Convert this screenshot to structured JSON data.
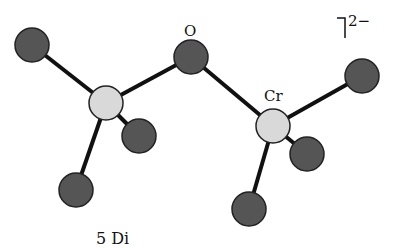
{
  "figure": {
    "charge_label": "2−",
    "labels": {
      "oxygen": "O",
      "chromium": "Cr"
    },
    "caption_fragment": "5  Di",
    "colors": {
      "oxygen_fill": "#555555",
      "chromium_fill": "#d9d9d9",
      "bond": "#111111",
      "outline": "#222222"
    },
    "atoms": [
      {
        "id": "O_bridge",
        "element": "O",
        "x": 191,
        "y": 57,
        "r": 17
      },
      {
        "id": "Cr1",
        "element": "Cr",
        "x": 106,
        "y": 103,
        "r": 17
      },
      {
        "id": "Cr2",
        "element": "Cr",
        "x": 273,
        "y": 126,
        "r": 17
      },
      {
        "id": "O1a",
        "element": "O",
        "x": 32,
        "y": 45,
        "r": 17
      },
      {
        "id": "O1b",
        "element": "O",
        "x": 139,
        "y": 136,
        "r": 17
      },
      {
        "id": "O1c",
        "element": "O",
        "x": 76,
        "y": 190,
        "r": 17
      },
      {
        "id": "O2a",
        "element": "O",
        "x": 362,
        "y": 76,
        "r": 17
      },
      {
        "id": "O2b",
        "element": "O",
        "x": 307,
        "y": 154,
        "r": 17
      },
      {
        "id": "O2c",
        "element": "O",
        "x": 249,
        "y": 209,
        "r": 17
      }
    ],
    "bonds": [
      [
        "Cr1",
        "O_bridge"
      ],
      [
        "O_bridge",
        "Cr2"
      ],
      [
        "Cr1",
        "O1a"
      ],
      [
        "Cr1",
        "O1b"
      ],
      [
        "Cr1",
        "O1c"
      ],
      [
        "Cr2",
        "O2a"
      ],
      [
        "Cr2",
        "O2b"
      ],
      [
        "Cr2",
        "O2c"
      ]
    ]
  }
}
